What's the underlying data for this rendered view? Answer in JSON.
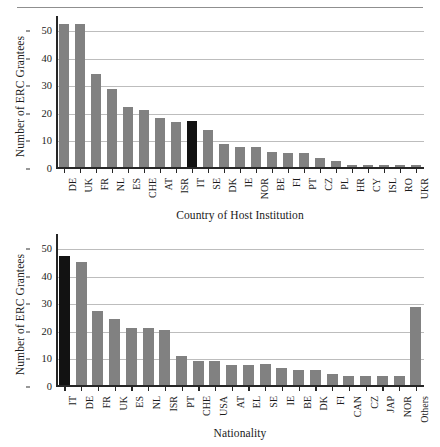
{
  "page": {
    "divider": "horizontal-rule"
  },
  "charts": [
    {
      "id": "host-institution",
      "ylabel": "Number of ERC Grantees",
      "xlabel": "Country of Host Institution",
      "yticks": [
        "0",
        "10",
        "20",
        "30",
        "40",
        "50"
      ]
    },
    {
      "id": "nationality",
      "ylabel": "Number of ERC Grantees",
      "xlabel": "Nationality",
      "yticks": [
        "0",
        "10",
        "20",
        "30",
        "40",
        "50"
      ]
    }
  ],
  "chart_data": [
    {
      "type": "bar",
      "id": "host-institution",
      "title": "",
      "xlabel": "Country of Host Institution",
      "ylabel": "Number of ERC Grantees",
      "ylim": [
        0,
        52
      ],
      "yticks": [
        0,
        10,
        20,
        30,
        40,
        50
      ],
      "grid": true,
      "legend": "none",
      "highlight_category": "IT",
      "highlight_color": "#121212",
      "bar_color": "#818181",
      "categories": [
        "DE",
        "UK",
        "FR",
        "NL",
        "ES",
        "CHE",
        "AT",
        "ISR",
        "IT",
        "SE",
        "DK",
        "IE",
        "NOR",
        "BE",
        "FI",
        "PT",
        "CZ",
        "PL",
        "HR",
        "CY",
        "ISL",
        "RO",
        "UKR"
      ],
      "values": [
        52,
        52,
        34,
        28.5,
        22,
        21,
        18,
        16.5,
        17,
        13.5,
        8.5,
        7.3,
        7.3,
        5.5,
        5.4,
        5.4,
        3.5,
        2.4,
        0.8,
        0.8,
        0.8,
        0.8,
        0.8
      ],
      "notes": "DE and UK bars are clipped at the top of the plotted range (values exceed 50)"
    },
    {
      "type": "bar",
      "id": "nationality",
      "title": "",
      "xlabel": "Nationality",
      "ylabel": "Number of ERC Grantees",
      "ylim": [
        0,
        52
      ],
      "yticks": [
        0,
        10,
        20,
        30,
        40,
        50
      ],
      "grid": true,
      "legend": "none",
      "highlight_category": "IT",
      "highlight_color": "#121212",
      "bar_color": "#818181",
      "categories": [
        "IT",
        "DE",
        "FR",
        "UK",
        "ES",
        "NL",
        "ISR",
        "PT",
        "CHE",
        "USA",
        "AT",
        "EL",
        "SE",
        "IE",
        "BE",
        "DK",
        "FI",
        "CAN",
        "CZ",
        "JAP",
        "NOR",
        "Others"
      ],
      "values": [
        47,
        45,
        27,
        24,
        20.7,
        20.7,
        20,
        10.8,
        9,
        9,
        7.6,
        7.6,
        7.7,
        6.3,
        5.5,
        5.5,
        4.3,
        3.5,
        3.5,
        3.5,
        3.5,
        28.5
      ]
    }
  ]
}
